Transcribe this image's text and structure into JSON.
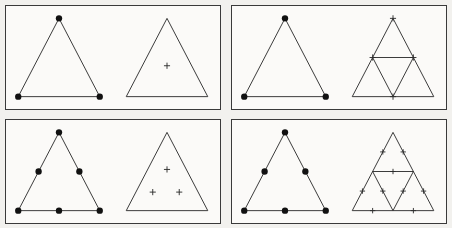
{
  "figure": {
    "background_color": "#f2f1ee",
    "panel_background": "#fbfaf8",
    "ink_color": "#2b2b2b",
    "dot_color": "#111111",
    "panel_count": 4,
    "grid": {
      "rows": 2,
      "columns": 2
    }
  },
  "panels": [
    {
      "id": "panel-top-left",
      "position": "top-left",
      "left_figure": {
        "name": "dotted-triangle",
        "outline": "triangle",
        "dot_count": 3,
        "dot_label": "3 dots",
        "dots": [
          {
            "label": "apex",
            "x": 50,
            "y": 12
          },
          {
            "label": "bottom-left",
            "x": 10,
            "y": 88
          },
          {
            "label": "bottom-right",
            "x": 90,
            "y": 88
          }
        ],
        "subdivision_level": 0
      },
      "right_figure": {
        "name": "plain-triangle-with-marks",
        "outline": "triangle",
        "mark_glyph": "plus",
        "mark_count": 1,
        "mark_label": "1 plus",
        "marks": [
          {
            "x": 50,
            "y": 58
          }
        ],
        "subdivision_level": 0,
        "internal_lines": 0
      }
    },
    {
      "id": "panel-top-right",
      "position": "top-right",
      "left_figure": {
        "name": "dotted-triangle",
        "outline": "triangle",
        "dot_count": 3,
        "dot_label": "3 dots",
        "dots": [
          {
            "label": "apex",
            "x": 50,
            "y": 12
          },
          {
            "label": "bottom-left",
            "x": 10,
            "y": 88
          },
          {
            "label": "bottom-right",
            "x": 90,
            "y": 88
          }
        ],
        "subdivision_level": 0
      },
      "right_figure": {
        "name": "subdivided-triangle-with-marks",
        "outline": "triangle",
        "mark_glyph": "plus",
        "mark_count": 4,
        "mark_label": "4 plus marks",
        "marks": [
          {
            "label": "apex",
            "x": 50,
            "y": 12
          },
          {
            "label": "left-edge-mid",
            "x": 30,
            "y": 50
          },
          {
            "label": "right-edge-mid",
            "x": 70,
            "y": 50
          },
          {
            "label": "base-mid",
            "x": 50,
            "y": 88
          }
        ],
        "subdivision_level": 1,
        "internal_lines": 3,
        "sub_triangles": 4
      }
    },
    {
      "id": "panel-bottom-left",
      "position": "bottom-left",
      "left_figure": {
        "name": "dotted-triangle",
        "outline": "triangle",
        "dot_count": 6,
        "dot_label": "6 dots",
        "dots": [
          {
            "label": "apex",
            "x": 50,
            "y": 12
          },
          {
            "label": "left-edge-mid",
            "x": 30,
            "y": 50
          },
          {
            "label": "right-edge-mid",
            "x": 70,
            "y": 50
          },
          {
            "label": "bottom-left",
            "x": 10,
            "y": 88
          },
          {
            "label": "base-mid",
            "x": 50,
            "y": 88
          },
          {
            "label": "bottom-right",
            "x": 90,
            "y": 88
          }
        ],
        "subdivision_level": 1
      },
      "right_figure": {
        "name": "plain-triangle-with-marks",
        "outline": "triangle",
        "mark_glyph": "plus",
        "mark_count": 3,
        "mark_label": "3 plus marks",
        "marks": [
          {
            "label": "top",
            "x": 50,
            "y": 48
          },
          {
            "label": "bottom-left",
            "x": 36,
            "y": 70
          },
          {
            "label": "bottom-right",
            "x": 62,
            "y": 70
          }
        ],
        "subdivision_level": 0,
        "internal_lines": 0
      }
    },
    {
      "id": "panel-bottom-right",
      "position": "bottom-right",
      "left_figure": {
        "name": "dotted-triangle",
        "outline": "triangle",
        "dot_count": 6,
        "dot_label": "6 dots",
        "dots": [
          {
            "label": "apex",
            "x": 50,
            "y": 12
          },
          {
            "label": "left-edge-mid",
            "x": 30,
            "y": 50
          },
          {
            "label": "right-edge-mid",
            "x": 70,
            "y": 50
          },
          {
            "label": "bottom-left",
            "x": 10,
            "y": 88
          },
          {
            "label": "base-mid",
            "x": 50,
            "y": 88
          },
          {
            "label": "bottom-right",
            "x": 90,
            "y": 88
          }
        ],
        "subdivision_level": 1
      },
      "right_figure": {
        "name": "subdivided-triangle-with-tick-marks",
        "outline": "triangle",
        "mark_glyph": "tick",
        "mark_count": 9,
        "mark_label": "9 tick marks",
        "marks": [
          {
            "label": "top-tri-left-edge",
            "x": 40,
            "y": 31
          },
          {
            "label": "top-tri-right-edge",
            "x": 60,
            "y": 31
          },
          {
            "label": "mid-horizontal",
            "x": 50,
            "y": 50
          },
          {
            "label": "left-tri-left-edge",
            "x": 20,
            "y": 69
          },
          {
            "label": "left-tri-right-edge",
            "x": 40,
            "y": 69
          },
          {
            "label": "right-tri-left-edge",
            "x": 60,
            "y": 69
          },
          {
            "label": "right-tri-right-edge",
            "x": 80,
            "y": 69
          },
          {
            "label": "base-left",
            "x": 30,
            "y": 88
          },
          {
            "label": "base-right",
            "x": 70,
            "y": 88
          }
        ],
        "subdivision_level": 1,
        "internal_lines": 3,
        "sub_triangles": 4
      }
    }
  ]
}
